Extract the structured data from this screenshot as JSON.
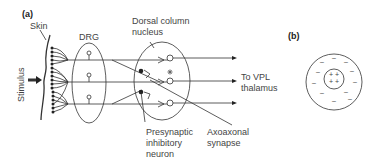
{
  "panels": {
    "a": "(a)",
    "b": "(b)"
  },
  "labels": {
    "skin": "Skin",
    "drg": "DRG",
    "stimulus": "Stimulus",
    "dorsal_column_1": "Dorsal column",
    "dorsal_column_2": "nucleus",
    "vpl_1": "To VPL",
    "vpl_2": "thalamus",
    "presynaptic_1": "Presynaptic",
    "presynaptic_2": "inhibitory",
    "presynaptic_3": "neuron",
    "axoaxonal_1": "Axoaxonal",
    "axoaxonal_2": "synapse"
  },
  "panel_b": {
    "inner_charges": [
      "+",
      "+",
      "+",
      "+"
    ],
    "outer_charges": "-"
  },
  "colors": {
    "line": "#333333",
    "text": "#444444",
    "background": "#ffffff"
  }
}
